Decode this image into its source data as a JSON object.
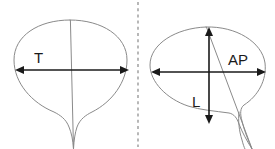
{
  "figure": {
    "background_color": "#ffffff",
    "outline_color": "#8a8a8a",
    "measure_color": "#1a1a1a",
    "divider_color": "#9a9a9a"
  },
  "panels": [
    {
      "id": "transverse-view",
      "name": "transverse-bladder-panel",
      "measurements": [
        {
          "id": "transverse-measure",
          "label": "T",
          "orientation": "horizontal",
          "label_x": 34,
          "label_y": 59
        }
      ]
    },
    {
      "id": "sagittal-view",
      "name": "sagittal-bladder-panel",
      "measurements": [
        {
          "id": "ap-measure",
          "label": "AP",
          "orientation": "horizontal",
          "label_x": 228,
          "label_y": 61
        },
        {
          "id": "longitudinal-measure",
          "label": "L",
          "orientation": "vertical",
          "label_x": 192,
          "label_y": 103
        }
      ]
    }
  ],
  "divider": {
    "label": "panel-divider",
    "style": "dashed-vertical"
  }
}
